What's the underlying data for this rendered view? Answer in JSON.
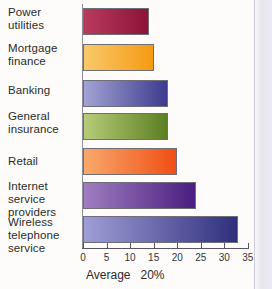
{
  "chart_data": {
    "type": "bar",
    "orientation": "horizontal",
    "title": "",
    "xlabel": "",
    "ylabel": "",
    "categories": [
      "Power\nutilities",
      "Mortgage\nfinance",
      "Banking",
      "General\ninsurance",
      "Retail",
      "Internet\nservice\nproviders",
      "Wireless\ntelephone\nservice"
    ],
    "values": [
      14,
      15,
      18,
      18,
      20,
      24,
      33
    ],
    "xlim": [
      0,
      35
    ],
    "xticks": [
      0,
      5,
      10,
      15,
      20,
      25,
      30,
      35
    ],
    "xtick_labels": [
      "0",
      "5",
      "10",
      "15",
      "20",
      "25",
      "30",
      "35"
    ],
    "grid": false,
    "legend": "none",
    "annotations": [
      "Average   20%"
    ],
    "bar_colors": [
      {
        "from": "#b83a5f",
        "to": "#8c1338"
      },
      {
        "from": "#f9c96a",
        "to": "#f59a12"
      },
      {
        "from": "#a3a3d4",
        "to": "#3c3b8f"
      },
      {
        "from": "#b6cc79",
        "to": "#5d7f24"
      },
      {
        "from": "#f8a96b",
        "to": "#f04e14"
      },
      {
        "from": "#a07ec0",
        "to": "#4a1d80"
      },
      {
        "from": "#a09ed6",
        "to": "#2f2f7d"
      }
    ]
  },
  "caption": {
    "average_label": "Average   20%"
  }
}
